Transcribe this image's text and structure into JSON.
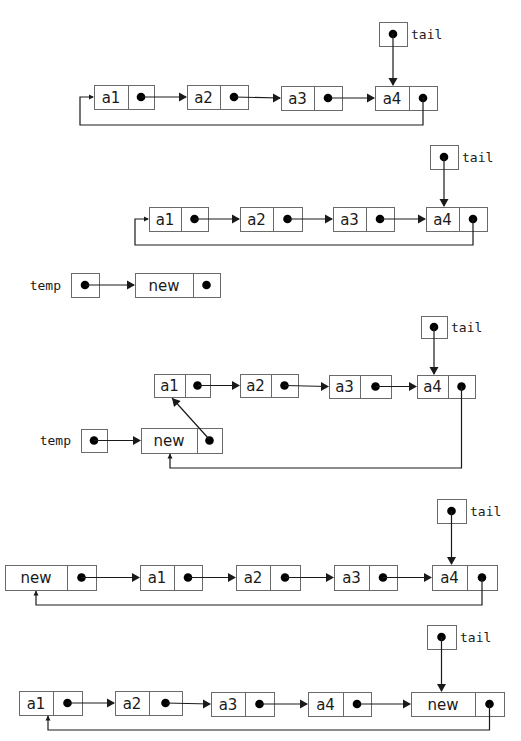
{
  "colors": {
    "stroke": "#1a1a1a",
    "box_border": "#6a6a6a",
    "dot": "#000000",
    "background": "#ffffff"
  },
  "labels": {
    "tail": "tail",
    "temp": "temp"
  },
  "diagrams": [
    {
      "id": "step1-initial",
      "caption": "Initial circular list with tail pointing to a4",
      "nodes": [
        {
          "id": "a1",
          "label": "a1",
          "x": 94,
          "y": 85,
          "w": 60,
          "h": 24,
          "div": 34
        },
        {
          "id": "a2",
          "label": "a2",
          "x": 187,
          "y": 85,
          "w": 61,
          "h": 24,
          "div": 33
        },
        {
          "id": "a3",
          "label": "a3",
          "x": 281,
          "y": 86,
          "w": 61,
          "h": 24,
          "div": 33
        },
        {
          "id": "a4",
          "label": "a4",
          "x": 375,
          "y": 86,
          "w": 62,
          "h": 24,
          "div": 34
        }
      ],
      "pointers": [
        {
          "id": "tail",
          "label": "tail",
          "x": 379,
          "y": 22,
          "w": 28,
          "h": 24,
          "target": "a4",
          "labelSide": "right"
        }
      ],
      "links": [
        [
          "a1",
          "a2"
        ],
        [
          "a2",
          "a3"
        ],
        [
          "a3",
          "a4"
        ]
      ],
      "loop": {
        "from": "a4",
        "to": "a1",
        "y": 125,
        "entry": "left"
      }
    },
    {
      "id": "step2-create-temp",
      "caption": "Create new node referenced by temp",
      "nodes": [
        {
          "id": "a1",
          "label": "a1",
          "x": 149,
          "y": 207,
          "w": 59,
          "h": 24,
          "div": 32
        },
        {
          "id": "a2",
          "label": "a2",
          "x": 240,
          "y": 207,
          "w": 62,
          "h": 24,
          "div": 33
        },
        {
          "id": "a3",
          "label": "a3",
          "x": 333,
          "y": 207,
          "w": 61,
          "h": 24,
          "div": 33
        },
        {
          "id": "a4",
          "label": "a4",
          "x": 426,
          "y": 207,
          "w": 61,
          "h": 24,
          "div": 33
        },
        {
          "id": "new",
          "label": "new",
          "x": 135,
          "y": 273,
          "w": 85,
          "h": 24,
          "div": 58
        }
      ],
      "pointers": [
        {
          "id": "tail",
          "label": "tail",
          "x": 430,
          "y": 145,
          "w": 28,
          "h": 24,
          "target": "a4",
          "labelSide": "right"
        },
        {
          "id": "temp",
          "label": "temp",
          "x": 71,
          "y": 273,
          "w": 28,
          "h": 24,
          "target": "new",
          "labelSide": "left",
          "direction": "right"
        }
      ],
      "links": [
        [
          "a1",
          "a2"
        ],
        [
          "a2",
          "a3"
        ],
        [
          "a3",
          "a4"
        ]
      ],
      "loop": {
        "from": "a4",
        "to": "a1",
        "y": 245,
        "entry": "left"
      }
    },
    {
      "id": "step3-link-new",
      "caption": "new.next = a1; a4.next = new",
      "nodes": [
        {
          "id": "a1",
          "label": "a1",
          "x": 154,
          "y": 374,
          "w": 56,
          "h": 23,
          "div": 31
        },
        {
          "id": "a2",
          "label": "a2",
          "x": 240,
          "y": 374,
          "w": 58,
          "h": 23,
          "div": 31
        },
        {
          "id": "a3",
          "label": "a3",
          "x": 329,
          "y": 375,
          "w": 62,
          "h": 23,
          "div": 31
        },
        {
          "id": "a4",
          "label": "a4",
          "x": 417,
          "y": 375,
          "w": 58,
          "h": 23,
          "div": 31
        },
        {
          "id": "new",
          "label": "new",
          "x": 141,
          "y": 428,
          "w": 81,
          "h": 25,
          "div": 56
        }
      ],
      "pointers": [
        {
          "id": "tail",
          "label": "tail",
          "x": 421,
          "y": 316,
          "w": 26,
          "h": 22,
          "target": "a4",
          "labelSide": "right"
        },
        {
          "id": "temp",
          "label": "temp",
          "x": 81,
          "y": 429,
          "w": 26,
          "h": 23,
          "target": "new",
          "labelSide": "left",
          "direction": "right"
        }
      ],
      "links": [
        [
          "a1",
          "a2"
        ],
        [
          "a2",
          "a3"
        ],
        [
          "a3",
          "a4"
        ]
      ],
      "diagonal": {
        "from": "new",
        "to": "a1",
        "x1": 209,
        "y1": 439,
        "x2": 172,
        "y2": 398
      },
      "loop": {
        "from": "a4",
        "to": "new",
        "y": 468,
        "entry": "bottom"
      }
    },
    {
      "id": "step4-new-first",
      "caption": "Resulting circular list with new before a1",
      "nodes": [
        {
          "id": "new",
          "label": "new",
          "x": 5,
          "y": 565,
          "w": 91,
          "h": 25,
          "div": 62
        },
        {
          "id": "a1",
          "label": "a1",
          "x": 140,
          "y": 565,
          "w": 62,
          "h": 25,
          "div": 34
        },
        {
          "id": "a2",
          "label": "a2",
          "x": 236,
          "y": 565,
          "w": 64,
          "h": 25,
          "div": 34
        },
        {
          "id": "a3",
          "label": "a3",
          "x": 334,
          "y": 565,
          "w": 63,
          "h": 25,
          "div": 35
        },
        {
          "id": "a4",
          "label": "a4",
          "x": 432,
          "y": 565,
          "w": 65,
          "h": 25,
          "div": 35
        }
      ],
      "pointers": [
        {
          "id": "tail",
          "label": "tail",
          "x": 437,
          "y": 499,
          "w": 29,
          "h": 24,
          "target": "a4",
          "labelSide": "right"
        }
      ],
      "links": [
        [
          "new",
          "a1"
        ],
        [
          "a1",
          "a2"
        ],
        [
          "a2",
          "a3"
        ],
        [
          "a3",
          "a4"
        ]
      ],
      "loop": {
        "from": "a4",
        "to": "new",
        "y": 605,
        "entry": "bottom"
      }
    },
    {
      "id": "step5-tail-updated",
      "caption": "tail = new; new becomes last node",
      "nodes": [
        {
          "id": "a1",
          "label": "a1",
          "x": 19,
          "y": 691,
          "w": 63,
          "h": 24,
          "div": 34
        },
        {
          "id": "a2",
          "label": "a2",
          "x": 115,
          "y": 691,
          "w": 67,
          "h": 24,
          "div": 34
        },
        {
          "id": "a3",
          "label": "a3",
          "x": 211,
          "y": 692,
          "w": 63,
          "h": 24,
          "div": 34
        },
        {
          "id": "a4",
          "label": "a4",
          "x": 308,
          "y": 692,
          "w": 63,
          "h": 24,
          "div": 35
        },
        {
          "id": "new",
          "label": "new",
          "x": 411,
          "y": 692,
          "w": 93,
          "h": 24,
          "div": 64
        }
      ],
      "pointers": [
        {
          "id": "tail",
          "label": "tail",
          "x": 427,
          "y": 625,
          "w": 29,
          "h": 24,
          "target": "new",
          "labelSide": "right"
        }
      ],
      "links": [
        [
          "a1",
          "a2"
        ],
        [
          "a2",
          "a3"
        ],
        [
          "a3",
          "a4"
        ],
        [
          "a4",
          "new"
        ]
      ],
      "loop": {
        "from": "new",
        "to": "a1",
        "y": 730,
        "entry": "bottom"
      }
    }
  ]
}
